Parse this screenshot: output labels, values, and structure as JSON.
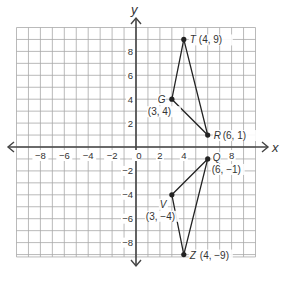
{
  "figure": {
    "type": "coordinate-plane",
    "axes": {
      "x_label": "x",
      "y_label": "y",
      "x_range": [
        -10,
        10
      ],
      "y_range": [
        -9,
        10
      ],
      "x_ticks": [
        "-8",
        "-6",
        "-4",
        "-2",
        "0",
        "2",
        "4",
        "8"
      ],
      "y_ticks": [
        "8",
        "6",
        "4",
        "2",
        "-2",
        "-4",
        "-6",
        "-8"
      ],
      "origin_label": "0"
    },
    "triangles": [
      {
        "name": "TGR",
        "vertices": [
          {
            "name": "T",
            "coords": "(4, 9)",
            "x": 4,
            "y": 9
          },
          {
            "name": "G",
            "coords": "(3, 4)",
            "x": 3,
            "y": 4
          },
          {
            "name": "R",
            "coords": "(6, 1)",
            "x": 6,
            "y": 1
          }
        ]
      },
      {
        "name": "QVZ",
        "vertices": [
          {
            "name": "Q",
            "coords": "(6, −1)",
            "x": 6,
            "y": -1
          },
          {
            "name": "V",
            "coords": "(3, −4)",
            "x": 3,
            "y": -4
          },
          {
            "name": "Z",
            "coords": "(4, −9)",
            "x": 4,
            "y": -9
          }
        ]
      }
    ],
    "colors": {
      "grid": "#9a9a9a",
      "axis": "#444444",
      "shape": "#222222",
      "text": "#333333"
    }
  }
}
